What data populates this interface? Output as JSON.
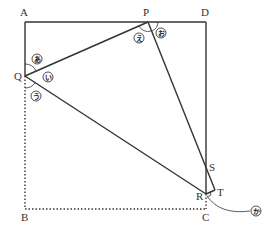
{
  "diagram": {
    "type": "folded-square",
    "points": {
      "A": {
        "label": "A",
        "x": 25,
        "y": 22
      },
      "D": {
        "label": "D",
        "x": 206,
        "y": 22
      },
      "B": {
        "label": "B",
        "x": 25,
        "y": 209
      },
      "C": {
        "label": "C",
        "x": 206,
        "y": 209
      },
      "P": {
        "label": "P",
        "x": 148,
        "y": 22
      },
      "Q": {
        "label": "Q",
        "x": 25,
        "y": 76
      },
      "R": {
        "label": "R",
        "x": 206,
        "y": 194
      },
      "S": {
        "label": "S",
        "x": 206,
        "y": 165
      },
      "T": {
        "label": "T",
        "x": 215,
        "y": 190
      }
    },
    "angle_marks": [
      {
        "label": "あ",
        "at": "Q",
        "position": "upper"
      },
      {
        "label": "い",
        "at": "Q",
        "position": "middle"
      },
      {
        "label": "う",
        "at": "Q",
        "position": "lower"
      },
      {
        "label": "え",
        "at": "P",
        "position": "left"
      },
      {
        "label": "お",
        "at": "P",
        "position": "right"
      },
      {
        "label": "か",
        "at": "R",
        "position": "callout"
      }
    ],
    "colors": {
      "line": "#333333",
      "background": "#ffffff"
    }
  }
}
